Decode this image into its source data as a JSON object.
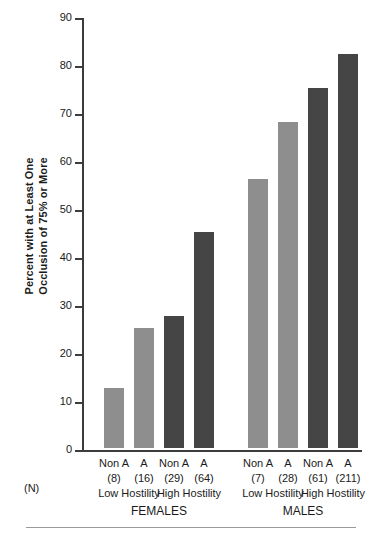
{
  "chart_data": {
    "type": "bar",
    "title": "",
    "xlabel": "",
    "ylabel_line1": "Percent with at Least One",
    "ylabel_line2": "Occlusion of 75% or More",
    "ylim": [
      0,
      90
    ],
    "ytick_values": [
      0,
      10,
      20,
      30,
      40,
      50,
      60,
      70,
      80,
      90
    ],
    "ytick_labels": [
      "0",
      "10",
      "20",
      "30",
      "40",
      "50",
      "60",
      "70",
      "80",
      "90"
    ],
    "grid": false,
    "legend_position": "none",
    "n_row_label": "(N)",
    "categories": [
      "Non A",
      "A",
      "Non A",
      "A",
      "Non A",
      "A",
      "Non A",
      "A"
    ],
    "values": [
      12.5,
      25,
      27.5,
      45,
      56,
      68,
      75,
      82
    ],
    "n_values": [
      "(8)",
      "(16)",
      "(29)",
      "(64)",
      "(7)",
      "(28)",
      "(61)",
      "(211)"
    ],
    "bar_colors": [
      "#8e8e8e",
      "#8e8e8e",
      "#454545",
      "#454545",
      "#8e8e8e",
      "#8e8e8e",
      "#454545",
      "#454545"
    ],
    "hostility_groups": [
      "Low Hostility",
      "High Hostility",
      "Low Hostility",
      "High Hostility"
    ],
    "sex_groups": [
      "FEMALES",
      "MALES"
    ],
    "colors": {
      "light_gray_bar": "#8e8e8e",
      "dark_gray_bar": "#454545",
      "axis": "#3c3c3c",
      "background": "#ffffff",
      "footer_rule": "#9a9a9a"
    }
  }
}
